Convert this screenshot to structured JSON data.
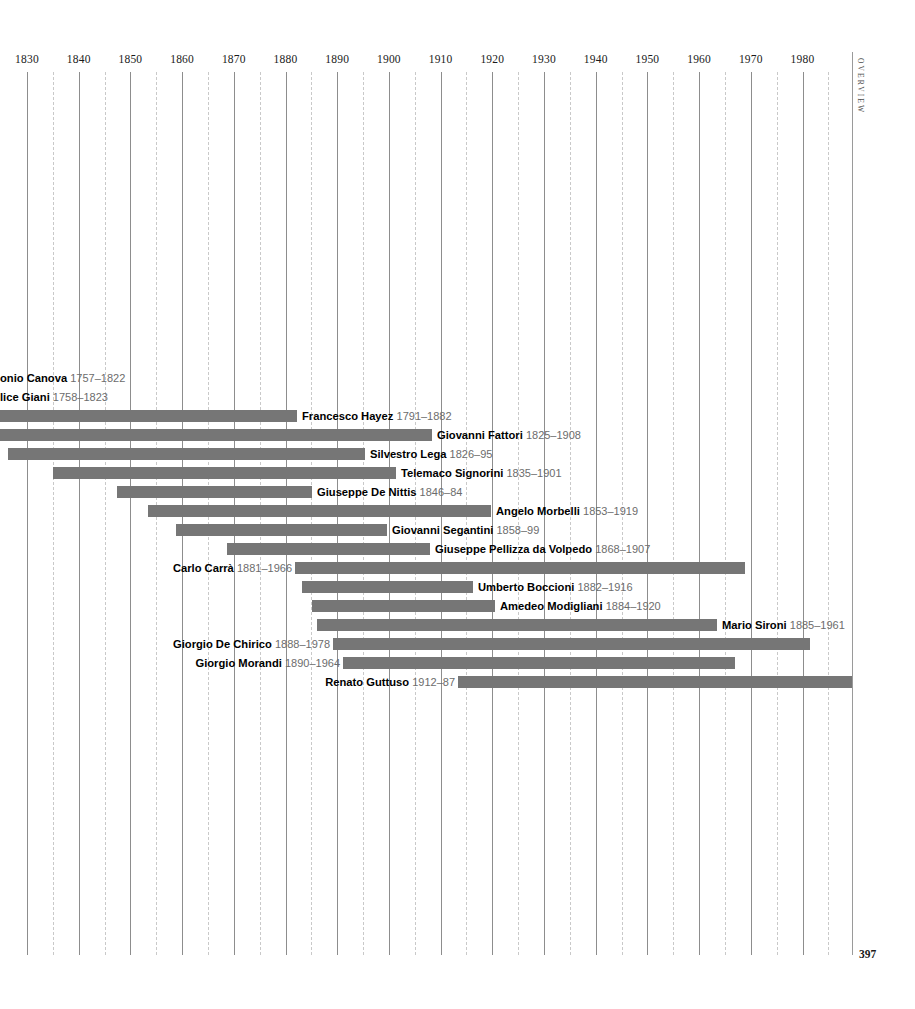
{
  "page": {
    "folio": "397",
    "running_head": "OVERVIEW"
  },
  "chart_data": {
    "type": "bar",
    "orientation": "horizontal",
    "subtype": "timeline-lifespan-gantt",
    "title": "",
    "xlabel": "",
    "ylabel": "",
    "xlim": [
      1825,
      1990
    ],
    "grid": true,
    "grid_major_step": 10,
    "grid_minor_step": 5,
    "legend": "none",
    "bar_color": "#767676",
    "gridline_major_color": "#8d8d8d",
    "gridline_minor_color": "#c9c9c9",
    "axis_ticks": [
      1830,
      1840,
      1850,
      1860,
      1870,
      1880,
      1890,
      1900,
      1910,
      1920,
      1930,
      1940,
      1950,
      1960,
      1970,
      1980
    ],
    "minor_ticks": [
      1835,
      1845,
      1855,
      1865,
      1875,
      1885,
      1895,
      1905,
      1915,
      1925,
      1935,
      1945,
      1955,
      1965,
      1975,
      1985
    ],
    "categories": [
      "Antonio Canova",
      "Felice Giani",
      "Francesco Hayez",
      "Giovanni Fattori",
      "Silvestro Lega",
      "Telemaco Signorini",
      "Giuseppe De Nittis",
      "Angelo Morbelli",
      "Giovanni Segantini",
      "Giuseppe Pellizza da Volpedo",
      "Carlo Carrà",
      "Umberto Boccioni",
      "Amedeo Modigliani",
      "Mario Sironi",
      "Giorgio De Chirico",
      "Giorgio Morandi",
      "Renato Guttuso"
    ],
    "spans": [
      [
        1757,
        1822
      ],
      [
        1758,
        1823
      ],
      [
        1791,
        1882
      ],
      [
        1825,
        1908
      ],
      [
        1826,
        1895
      ],
      [
        1835,
        1901
      ],
      [
        1846,
        1884
      ],
      [
        1853,
        1919
      ],
      [
        1858,
        1899
      ],
      [
        1868,
        1907
      ],
      [
        1881,
        1966
      ],
      [
        1882,
        1916
      ],
      [
        1884,
        1920
      ],
      [
        1885,
        1961
      ],
      [
        1888,
        1978
      ],
      [
        1890,
        1964
      ],
      [
        1912,
        1987
      ]
    ]
  },
  "rows": [
    {
      "name": "onio Canova",
      "dates": "1757–1822",
      "clipped_left": true,
      "label_side": "after",
      "start": 1757,
      "end": 1822,
      "top": 369,
      "label_x": 0,
      "bar_visible": false
    },
    {
      "name": "lice Giani",
      "dates": "1758–1823",
      "clipped_left": true,
      "label_side": "after",
      "start": 1758,
      "end": 1823,
      "top": 388,
      "label_x": 0,
      "bar_visible": false
    },
    {
      "name": "Francesco Hayez",
      "dates": "1791–1882",
      "label_side": "after",
      "start": 1791,
      "end": 1882,
      "top": 407,
      "bar_left": 0,
      "bar_right": 297,
      "label_x": 302
    },
    {
      "name": "Giovanni Fattori",
      "dates": "1825–1908",
      "label_side": "after",
      "start": 1825,
      "end": 1908,
      "top": 426,
      "bar_left": 0,
      "bar_right": 432,
      "label_x": 437
    },
    {
      "name": "Silvestro Lega",
      "dates": "1826–95",
      "label_side": "after",
      "start": 1826,
      "end": 1895,
      "top": 445,
      "bar_left": 8,
      "bar_right": 365,
      "label_x": 370
    },
    {
      "name": "Telemaco Signorini",
      "dates": "1835–1901",
      "label_side": "after",
      "start": 1835,
      "end": 1901,
      "top": 464,
      "bar_left": 53,
      "bar_right": 396,
      "label_x": 401
    },
    {
      "name": "Giuseppe De Nittis",
      "dates": "1846–84",
      "label_side": "after",
      "start": 1846,
      "end": 1884,
      "top": 483,
      "bar_left": 117,
      "bar_right": 312,
      "label_x": 317
    },
    {
      "name": "Angelo Morbelli",
      "dates": "1853–1919",
      "label_side": "after",
      "start": 1853,
      "end": 1919,
      "top": 502,
      "bar_left": 148,
      "bar_right": 491,
      "label_x": 496
    },
    {
      "name": "Giovanni Segantini",
      "dates": "1858–99",
      "label_side": "after",
      "start": 1858,
      "end": 1899,
      "top": 521,
      "bar_left": 176,
      "bar_right": 387,
      "label_x": 392
    },
    {
      "name": "Giuseppe Pellizza da Volpedo",
      "dates": "1868–1907",
      "label_side": "after",
      "start": 1868,
      "end": 1907,
      "top": 540,
      "bar_left": 227,
      "bar_right": 430,
      "label_x": 435
    },
    {
      "name": "Carlo Carrà",
      "dates": "1881–1966",
      "label_side": "before",
      "start": 1881,
      "end": 1966,
      "top": 559,
      "bar_left": 295,
      "bar_right": 745,
      "label_right_x": 292
    },
    {
      "name": "Umberto Boccioni",
      "dates": "1882–1916",
      "label_side": "after",
      "start": 1882,
      "end": 1916,
      "top": 578,
      "bar_left": 302,
      "bar_right": 473,
      "label_x": 478
    },
    {
      "name": "Amedeo Modigliani",
      "dates": "1884–1920",
      "label_side": "after",
      "start": 1884,
      "end": 1920,
      "top": 597,
      "bar_left": 312,
      "bar_right": 495,
      "label_x": 500
    },
    {
      "name": "Mario Sironi",
      "dates": "1885–1961",
      "label_side": "after",
      "start": 1885,
      "end": 1961,
      "top": 616,
      "bar_left": 317,
      "bar_right": 717,
      "label_x": 722
    },
    {
      "name": "Giorgio De Chirico",
      "dates": "1888–1978",
      "label_side": "before",
      "start": 1888,
      "end": 1978,
      "top": 635,
      "bar_left": 333,
      "bar_right": 810,
      "label_right_x": 330
    },
    {
      "name": "Giorgio Morandi",
      "dates": "1890–1964",
      "label_side": "before",
      "start": 1890,
      "end": 1964,
      "top": 654,
      "bar_left": 343,
      "bar_right": 735,
      "label_right_x": 340
    },
    {
      "name": "Renato Guttuso",
      "dates": "1912–87",
      "label_side": "before",
      "start": 1912,
      "end": 1987,
      "top": 673,
      "bar_left": 458,
      "bar_right": 853,
      "label_right_x": 455
    }
  ]
}
